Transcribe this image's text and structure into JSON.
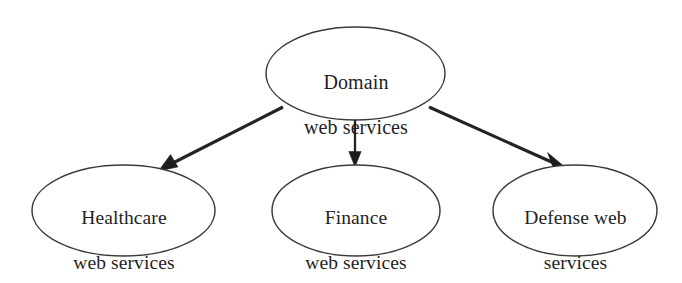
{
  "diagram": {
    "type": "hierarchy-tree",
    "background_color": "#ffffff",
    "node_stroke_color": "#3a3a3a",
    "edge_color": "#232323",
    "text_color": "#1f1f1f",
    "nodes": {
      "root": {
        "id": "domain-web-services",
        "shape": "ellipse",
        "line1": "Domain",
        "line2": "web services",
        "full_text": "Domain web services"
      },
      "children": [
        {
          "id": "healthcare-web-services",
          "shape": "ellipse",
          "line1": "Healthcare",
          "line2": "web services",
          "full_text": "Healthcare web services"
        },
        {
          "id": "finance-web-services",
          "shape": "ellipse",
          "line1": "Finance",
          "line2": "web services",
          "full_text": "Finance web services"
        },
        {
          "id": "defense-web-services",
          "shape": "ellipse",
          "line1": "Defense web",
          "line2": "services",
          "full_text": "Defense web services"
        }
      ]
    },
    "edges": [
      {
        "id": "edge-root-healthcare",
        "from": "Domain web services",
        "to": "Healthcare web services",
        "arrow": "single-head"
      },
      {
        "id": "edge-root-finance",
        "from": "Domain web services",
        "to": "Finance web services",
        "arrow": "single-head"
      },
      {
        "id": "edge-root-defense",
        "from": "Domain web services",
        "to": "Defense web services",
        "arrow": "single-head"
      }
    ]
  }
}
